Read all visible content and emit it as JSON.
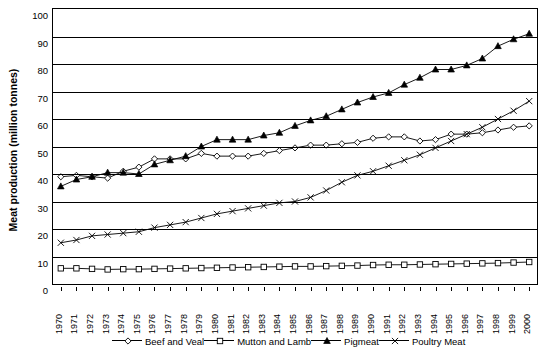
{
  "chart_data": {
    "type": "line",
    "title": "",
    "xlabel": "",
    "ylabel": "Meat production (million tonnes)",
    "ylim": [
      0,
      100
    ],
    "ytick_step": 10,
    "grid": true,
    "legend_position": "bottom",
    "categories": [
      "1970",
      "1971",
      "1972",
      "1973",
      "1974",
      "1975",
      "1976",
      "1977",
      "1978",
      "1979",
      "1980",
      "1981",
      "1982",
      "1983",
      "1984",
      "1985",
      "1986",
      "1987",
      "1988",
      "1989",
      "1990",
      "1991",
      "1992",
      "1993",
      "1994",
      "1995",
      "1996",
      "1997",
      "1998",
      "1999",
      "2000"
    ],
    "yticks": [
      "0",
      "10",
      "20",
      "30",
      "40",
      "50",
      "60",
      "70",
      "80",
      "90",
      "100"
    ],
    "series": [
      {
        "name": "Beef and Veal",
        "marker": "diamond",
        "values": [
          39.0,
          39.5,
          39.0,
          38.5,
          41.0,
          42.5,
          45.5,
          45.5,
          45.5,
          47.5,
          46.5,
          46.5,
          46.5,
          47.5,
          48.5,
          49.5,
          50.5,
          50.5,
          51.0,
          51.5,
          53.0,
          53.5,
          53.5,
          52.0,
          52.5,
          54.5,
          54.5,
          55.0,
          56.0,
          57.0,
          57.5
        ]
      },
      {
        "name": "Mutton and Lamb",
        "marker": "square",
        "values": [
          5.7,
          5.7,
          5.5,
          5.3,
          5.4,
          5.4,
          5.5,
          5.6,
          5.7,
          5.8,
          5.9,
          6.0,
          6.1,
          6.2,
          6.3,
          6.4,
          6.4,
          6.5,
          6.6,
          6.7,
          6.9,
          7.0,
          7.0,
          7.1,
          7.2,
          7.3,
          7.4,
          7.5,
          7.6,
          7.8,
          8.0
        ]
      },
      {
        "name": "Pigmeat",
        "marker": "triangle",
        "values": [
          35.5,
          38.0,
          39.0,
          40.5,
          40.5,
          40.0,
          43.5,
          45.0,
          46.5,
          50.0,
          52.5,
          52.5,
          52.5,
          54.0,
          55.0,
          57.5,
          59.5,
          61.0,
          63.5,
          66.0,
          68.0,
          69.5,
          72.5,
          75.0,
          78.0,
          78.0,
          79.5,
          82.0,
          86.5,
          89.0,
          91.0
        ]
      },
      {
        "name": "Poultry Meat",
        "marker": "cross",
        "values": [
          15.0,
          16.0,
          17.5,
          18.0,
          18.5,
          19.0,
          20.5,
          21.5,
          22.5,
          24.0,
          25.5,
          26.5,
          27.5,
          28.5,
          29.5,
          30.0,
          31.5,
          34.0,
          37.0,
          39.5,
          41.0,
          43.0,
          45.0,
          47.0,
          49.5,
          52.0,
          54.5,
          57.0,
          60.0,
          63.0,
          66.5
        ]
      }
    ]
  },
  "legend": {
    "items": [
      {
        "label": "Beef and Veal",
        "marker": "diamond"
      },
      {
        "label": "Mutton and Lamb",
        "marker": "square"
      },
      {
        "label": "Pigmeat",
        "marker": "triangle"
      },
      {
        "label": "Poultry Meat",
        "marker": "cross"
      }
    ]
  }
}
